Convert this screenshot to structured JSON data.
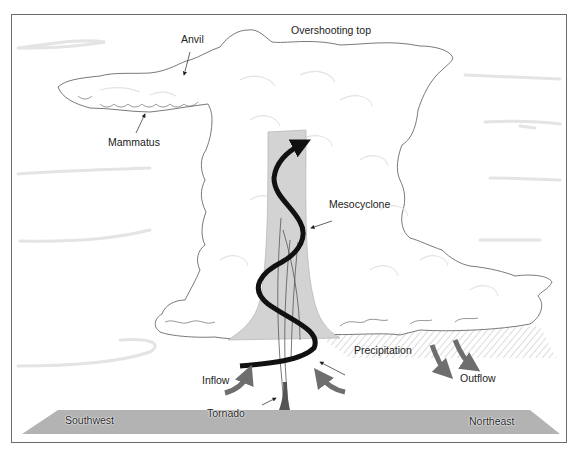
{
  "figure": {
    "colors": {
      "frame": "#6b6b6b",
      "background": "#ffffff",
      "cloud_fill": "#ffffff",
      "cloud_outline": "#6a6a6a",
      "sky_streaks": "#e4e4e4",
      "updraft_column": "#d3d3d3",
      "spiral_arrow": "#111111",
      "ground": "#b3b3b3",
      "flow_arrows": "#6e6e6e",
      "precipitation_hatch": "#9a9a9a"
    }
  },
  "labels": {
    "anvil": "Anvil",
    "overshooting_top": "Overshooting top",
    "mammatus": "Mammatus",
    "mesocyclone": "Mesocyclone",
    "precipitation": "Precipitation",
    "inflow": "Inflow",
    "outflow": "Outflow",
    "tornado": "Tornado",
    "southwest": "Southwest",
    "northeast": "Northeast"
  }
}
